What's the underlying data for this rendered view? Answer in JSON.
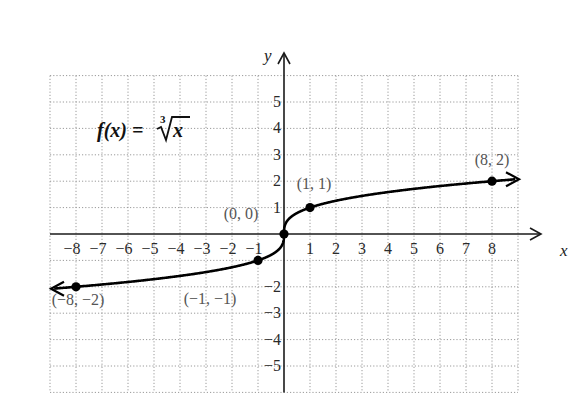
{
  "chart_data": {
    "type": "line",
    "function": {
      "name": "f",
      "variable": "x",
      "expression_label": "f(x) = ",
      "radical_index": "3",
      "radicand": "x"
    },
    "xlabel": "x",
    "ylabel": "y",
    "xlim": [
      -9,
      9
    ],
    "ylim": [
      -6,
      6
    ],
    "grid": true,
    "x_ticks": [
      -8,
      -7,
      -6,
      -5,
      -4,
      -3,
      -2,
      -1,
      1,
      2,
      3,
      4,
      5,
      6,
      7,
      8
    ],
    "x_tick_labels": [
      "−8",
      "−7",
      "−6",
      "−5",
      "−4",
      "−3",
      "−2",
      "−1",
      "1",
      "2",
      "3",
      "4",
      "5",
      "6",
      "7",
      "8"
    ],
    "y_ticks": [
      5,
      4,
      3,
      2,
      1,
      -2,
      -3,
      -4,
      -5
    ],
    "y_tick_labels": [
      "5",
      "4",
      "3",
      "2",
      "1",
      "−2",
      "−3",
      "−4",
      "−5"
    ],
    "series": [
      {
        "name": "f(x) = ∛x",
        "x_range": [
          -9,
          9
        ],
        "arrows_both_ends": true
      }
    ],
    "points": [
      {
        "x": -8,
        "y": -2,
        "label": "(−8, −2)"
      },
      {
        "x": -1,
        "y": -1,
        "label": "(−1, −1)"
      },
      {
        "x": 0,
        "y": 0,
        "label": "(0, 0)"
      },
      {
        "x": 1,
        "y": 1,
        "label": "(1, 1)"
      },
      {
        "x": 8,
        "y": 2,
        "label": "(8, 2)"
      }
    ]
  },
  "colors": {
    "grid": "#9a9a9a",
    "axis": "#1a1a1a",
    "curve": "#000000",
    "point_label": "#555555"
  }
}
